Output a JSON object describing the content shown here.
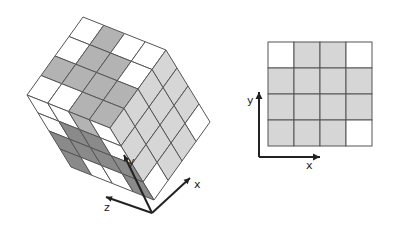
{
  "figure": {
    "left_panel": {
      "title": "3D 4x4x4 voxel cube",
      "origin": [
        83,
        17
      ],
      "vec_a": [
        83,
        33
      ],
      "vec_b": [
        -56,
        78
      ],
      "vec_c": [
        44,
        72
      ],
      "grid": 4,
      "top_face": [
        [
          "w",
          "g",
          "w",
          "w"
        ],
        [
          "w",
          "g",
          "g",
          "w"
        ],
        [
          "g",
          "g",
          "g",
          "g"
        ],
        [
          "w",
          "w",
          "g",
          "g"
        ]
      ],
      "right_face": [
        [
          "l",
          "l",
          "l",
          "w"
        ],
        [
          "l",
          "l",
          "l",
          "l"
        ],
        [
          "l",
          "l",
          "l",
          "l"
        ],
        [
          "l",
          "l",
          "l",
          "w"
        ]
      ],
      "left_face": [
        [
          "w",
          "w",
          "g",
          "w"
        ],
        [
          "w",
          "d",
          "d",
          "w"
        ],
        [
          "d",
          "d",
          "d",
          "d"
        ],
        [
          "d",
          "w",
          "w",
          "d"
        ]
      ],
      "axes": {
        "origin": [
          152,
          213
        ],
        "x": {
          "label": "x",
          "end": [
            190,
            178
          ]
        },
        "y": {
          "label": "y",
          "end": [
            124,
            155
          ]
        },
        "z": {
          "label": "z",
          "end": [
            106,
            197
          ]
        }
      }
    },
    "right_panel": {
      "title": "2D projection grid",
      "grid_x": 268,
      "grid_y": 42,
      "cell": 26,
      "grid": 4,
      "cells": [
        [
          "w",
          "l",
          "l",
          "w"
        ],
        [
          "l",
          "l",
          "l",
          "l"
        ],
        [
          "l",
          "l",
          "l",
          "l"
        ],
        [
          "l",
          "l",
          "l",
          "w"
        ]
      ],
      "axes": {
        "origin": [
          259,
          157
        ],
        "x": {
          "label": "x",
          "end": [
            320,
            157
          ]
        },
        "y": {
          "label": "y",
          "end": [
            259,
            92
          ]
        }
      }
    },
    "colors": {
      "w": "#ffffff",
      "l": "#d6d6d6",
      "g": "#b3b3b3",
      "d": "#8a8a8a",
      "line": "#555555",
      "axis": "#222222"
    }
  }
}
